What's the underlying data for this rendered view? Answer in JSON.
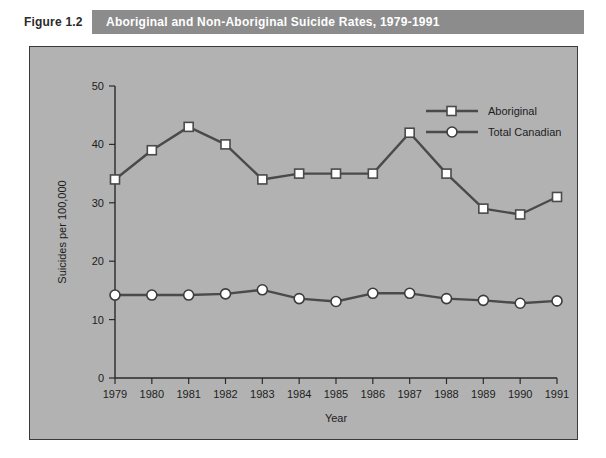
{
  "caption": {
    "figure_number": "Figure 1.2",
    "title": "Aboriginal and Non-Aboriginal Suicide Rates, 1979-1991"
  },
  "colors": {
    "caption_band": "#8c8c8c",
    "plot_background": "#b2b2b2",
    "frame_border": "#3a3a3a",
    "series_line": "#4a4a4a",
    "marker_fill": "#ffffff",
    "text": "#1d1d1d"
  },
  "chart_data": {
    "type": "line",
    "title": "Aboriginal and Non-Aboriginal Suicide Rates, 1979-1991",
    "xlabel": "Year",
    "ylabel": "Suicides per 100,000",
    "categories": [
      "1979",
      "1980",
      "1981",
      "1982",
      "1983",
      "1984",
      "1985",
      "1986",
      "1987",
      "1988",
      "1989",
      "1990",
      "1991"
    ],
    "x": [
      1979,
      1980,
      1981,
      1982,
      1983,
      1984,
      1985,
      1986,
      1987,
      1988,
      1989,
      1990,
      1991
    ],
    "xlim": [
      1979,
      1991
    ],
    "ylim": [
      0,
      50
    ],
    "yticks": [
      0,
      10,
      20,
      30,
      40,
      50
    ],
    "ytick_labels": [
      "0",
      "10",
      "20",
      "30",
      "40",
      "50"
    ],
    "grid": false,
    "legend_position": "top-right",
    "series": [
      {
        "name": "Aboriginal",
        "marker": "square",
        "values": [
          34,
          39,
          43,
          40,
          34,
          35,
          35,
          35,
          42,
          35,
          29,
          28,
          31
        ]
      },
      {
        "name": "Total Canadian",
        "marker": "circle",
        "values": [
          14.2,
          14.2,
          14.2,
          14.4,
          15.1,
          13.6,
          13.1,
          14.5,
          14.5,
          13.6,
          13.3,
          12.8,
          13.2
        ]
      }
    ]
  }
}
